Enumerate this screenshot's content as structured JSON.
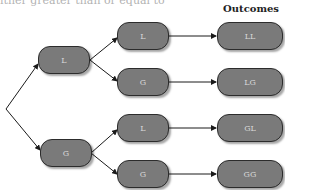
{
  "header_fragment": "ither greater than or equal to",
  "outcomes_title": "Outcomes",
  "tree": {
    "level1": [
      {
        "label": "L"
      },
      {
        "label": "G"
      }
    ],
    "level2": [
      {
        "label": "L"
      },
      {
        "label": "G"
      },
      {
        "label": "L"
      },
      {
        "label": "G"
      }
    ],
    "outcomes": [
      {
        "label": "LL"
      },
      {
        "label": "LG"
      },
      {
        "label": "GL"
      },
      {
        "label": "GG"
      }
    ]
  },
  "colors": {
    "node_fill": "#7a7a7a",
    "node_border": "#2c2c2c",
    "node_text": "#d8d8d8",
    "edge": "#1a1a1a"
  }
}
